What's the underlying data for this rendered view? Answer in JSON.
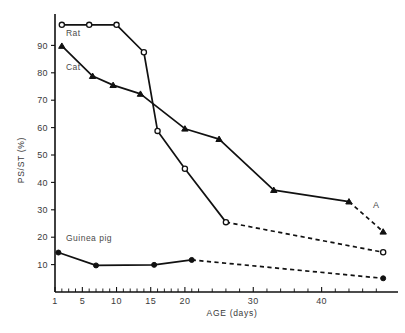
{
  "chart_data": {
    "type": "line",
    "title": "",
    "xlabel": "AGE (days)",
    "ylabel": "PS/ST (%)",
    "xlim": [
      1,
      50
    ],
    "ylim": [
      0,
      100
    ],
    "grid": false,
    "legend_position": "inline-labels",
    "x_ticks": [
      1,
      5,
      10,
      15,
      20,
      30,
      40
    ],
    "x_tick_labels": [
      "1",
      "5",
      "10",
      "15",
      "20",
      "30",
      "40"
    ],
    "x_minor_ticks": [
      2,
      3,
      4,
      6,
      7,
      8,
      9,
      11,
      12,
      13,
      14,
      16,
      17,
      18,
      19,
      21,
      22,
      24,
      26,
      28,
      32,
      34,
      36,
      38,
      42,
      44,
      46,
      48
    ],
    "y_ticks": [
      10,
      20,
      30,
      40,
      50,
      60,
      70,
      80,
      90
    ],
    "y_tick_labels": [
      "10",
      "20",
      "30",
      "40",
      "50",
      "60",
      "70",
      "80",
      "90"
    ],
    "annotations": [
      {
        "text": "A",
        "x": 47.5,
        "y": 30.5,
        "name": "panel-label-a"
      }
    ],
    "series": [
      {
        "name": "Rat",
        "marker": "open-circle",
        "label": "Rat",
        "label_x": 2.6,
        "label_y": 93.5,
        "solid_points": [
          {
            "x": 2.0,
            "y": 97.5
          },
          {
            "x": 6.0,
            "y": 97.5
          },
          {
            "x": 10.0,
            "y": 97.5
          },
          {
            "x": 14.0,
            "y": 87.5
          },
          {
            "x": 16.0,
            "y": 58.8
          },
          {
            "x": 20.0,
            "y": 45.0
          },
          {
            "x": 26.0,
            "y": 25.5
          }
        ],
        "dashed_points": [
          {
            "x": 26.0,
            "y": 25.5
          },
          {
            "x": 49.0,
            "y": 14.5
          }
        ]
      },
      {
        "name": "Cat",
        "marker": "filled-triangle",
        "label": "Cat",
        "label_x": 2.6,
        "label_y": 81.0,
        "solid_points": [
          {
            "x": 2.0,
            "y": 89.8
          },
          {
            "x": 6.5,
            "y": 78.8
          },
          {
            "x": 9.5,
            "y": 75.5
          },
          {
            "x": 13.5,
            "y": 72.3
          },
          {
            "x": 20.0,
            "y": 59.6
          },
          {
            "x": 25.0,
            "y": 55.8
          },
          {
            "x": 33.0,
            "y": 37.2
          },
          {
            "x": 44.0,
            "y": 33.0
          }
        ],
        "dashed_points": [
          {
            "x": 44.0,
            "y": 33.0
          },
          {
            "x": 49.0,
            "y": 22.0
          }
        ]
      },
      {
        "name": "Guinea pig",
        "marker": "filled-circle",
        "label": "Guinea pig",
        "label_x": 2.6,
        "label_y": 18.5,
        "solid_points": [
          {
            "x": 1.5,
            "y": 14.4
          },
          {
            "x": 7.0,
            "y": 9.7
          },
          {
            "x": 15.5,
            "y": 9.9
          },
          {
            "x": 21.0,
            "y": 11.7
          }
        ],
        "dashed_points": [
          {
            "x": 21.0,
            "y": 11.7
          },
          {
            "x": 49.0,
            "y": 5.0
          }
        ]
      }
    ]
  }
}
